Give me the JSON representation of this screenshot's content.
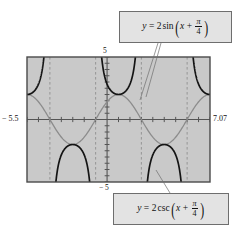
{
  "figure": {
    "background_color": "#ffffff",
    "plot_fill": "#c9c9c9",
    "frame_color": "#4a4a4a",
    "axis_color": "#555555",
    "sine_color": "#8c8c8c",
    "csc_color": "#141414",
    "asymptote_color": "#8f8f8f",
    "callout_fill": "#e3e3e3",
    "callout_border": "#6e6e6e"
  },
  "window": {
    "xmin_label": "− 5.5",
    "xmax_label": "7.07",
    "ymax_label": "5",
    "ymin_label": "− 5"
  },
  "callouts": {
    "sine": {
      "y": "y",
      "equals": "=",
      "coefficient": "2",
      "function": "sin",
      "variable": "x",
      "plus": "+",
      "numerator": "π",
      "denominator": "4",
      "open_paren": "(",
      "close_paren": ")"
    },
    "csc": {
      "y": "y",
      "equals": "=",
      "coefficient": "2",
      "function": "csc",
      "variable": "x",
      "plus": "+",
      "numerator": "π",
      "denominator": "4",
      "open_paren": "(",
      "close_paren": ")"
    }
  },
  "chart_data": {
    "type": "line",
    "title": "",
    "xlabel": "",
    "ylabel": "",
    "xlim": [
      -5.5,
      7.07
    ],
    "ylim": [
      -5,
      5
    ],
    "grid": false,
    "legend": "callout-boxes",
    "xtick_step": 0.7853981634,
    "ytick_step": 0.5,
    "asymptotes_x": [
      -3.926990817,
      -0.7853981634,
      2.35619449,
      5.497787144
    ],
    "series": [
      {
        "name": "y = 2 sin(x + π/4)",
        "color": "#8c8c8c",
        "style": "solid",
        "amplitude": 2,
        "phase_shift": 0.7853981634,
        "period": 6.283185307,
        "function": "2*sin(x + pi/4)"
      },
      {
        "name": "y = 2 csc(x + π/4)",
        "color": "#141414",
        "style": "solid",
        "amplitude": 2,
        "phase_shift": 0.7853981634,
        "period": 6.283185307,
        "function": "2/sin(x + pi/4)"
      }
    ]
  }
}
